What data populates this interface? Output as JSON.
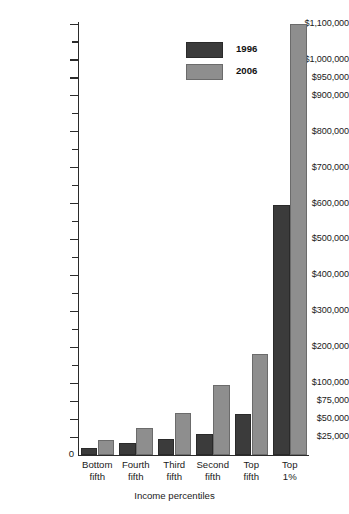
{
  "chart_data": {
    "type": "bar",
    "title": "",
    "subtitle": "",
    "xlabel": "Income percentiles",
    "ylabel": "",
    "grid": false,
    "legend_position": "top-center",
    "axis_note": "Non-uniform y-axis: fine $25,000 steps below $100,000, then $100,000 steps up to $1,100,000",
    "ylim": [
      0,
      1100000
    ],
    "categories": [
      "Bottom fifth",
      "Fourth fifth",
      "Third fifth",
      "Second fifth",
      "Top fifth",
      "Top 1%"
    ],
    "category_lines": [
      {
        "line1": "Bottom",
        "line2": "fifth"
      },
      {
        "line1": "Fourth",
        "line2": "fifth"
      },
      {
        "line1": "Third",
        "line2": "fifth"
      },
      {
        "line1": "Second",
        "line2": "fifth"
      },
      {
        "line1": "Top",
        "line2": "fifth"
      },
      {
        "line1": "Top",
        "line2": "1%"
      }
    ],
    "series": [
      {
        "name": "1996",
        "color": "#3b3b3b",
        "values": [
          10000,
          17000,
          22000,
          29000,
          57000,
          595000
        ]
      },
      {
        "name": "2006",
        "color": "#8e8e8e",
        "values": [
          21000,
          38000,
          58000,
          97000,
          180000,
          1100000
        ]
      }
    ],
    "ytick_values": [
      0,
      25000,
      50000,
      75000,
      100000,
      150000,
      200000,
      250000,
      300000,
      350000,
      400000,
      450000,
      500000,
      550000,
      600000,
      650000,
      700000,
      750000,
      800000,
      850000,
      900000,
      950000,
      1000000,
      1050000,
      1100000
    ],
    "ytick_labels": [
      {
        "value": 0,
        "text": "0",
        "labeled": true
      },
      {
        "value": 25000,
        "text": "$25,000",
        "labeled": true
      },
      {
        "value": 50000,
        "text": "$50,000",
        "labeled": true
      },
      {
        "value": 75000,
        "text": "$75,000",
        "labeled": true
      },
      {
        "value": 100000,
        "text": "$100,000",
        "labeled": true
      },
      {
        "value": 150000,
        "text": "",
        "labeled": false
      },
      {
        "value": 200000,
        "text": "$200,000",
        "labeled": true
      },
      {
        "value": 250000,
        "text": "",
        "labeled": false
      },
      {
        "value": 300000,
        "text": "$300,000",
        "labeled": true
      },
      {
        "value": 350000,
        "text": "",
        "labeled": false
      },
      {
        "value": 400000,
        "text": "$400,000",
        "labeled": true
      },
      {
        "value": 450000,
        "text": "",
        "labeled": false
      },
      {
        "value": 500000,
        "text": "$500,000",
        "labeled": true
      },
      {
        "value": 550000,
        "text": "",
        "labeled": false
      },
      {
        "value": 600000,
        "text": "$600,000",
        "labeled": true
      },
      {
        "value": 650000,
        "text": "",
        "labeled": false
      },
      {
        "value": 700000,
        "text": "$700,000",
        "labeled": true
      },
      {
        "value": 750000,
        "text": "",
        "labeled": false
      },
      {
        "value": 800000,
        "text": "$800,000",
        "labeled": true
      },
      {
        "value": 850000,
        "text": "",
        "labeled": false
      },
      {
        "value": 900000,
        "text": "$900,000",
        "labeled": true
      },
      {
        "value": 950000,
        "text": "$950,000",
        "labeled": true
      },
      {
        "value": 1000000,
        "text": "$1,000,000",
        "labeled": true
      },
      {
        "value": 1050000,
        "text": "",
        "labeled": false
      },
      {
        "value": 1100000,
        "text": "$1,100,000",
        "labeled": true
      }
    ]
  },
  "legend": {
    "entries": [
      {
        "label": "1996",
        "color": "#3b3b3b"
      },
      {
        "label": "2006",
        "color": "#8e8e8e"
      }
    ]
  },
  "axis": {
    "zero_label": "0",
    "x_title": "Income percentiles"
  },
  "colors": {
    "series_1996": "#3b3b3b",
    "series_2006": "#8e8e8e",
    "axis": "#2b2b2b",
    "background": "#ffffff"
  }
}
